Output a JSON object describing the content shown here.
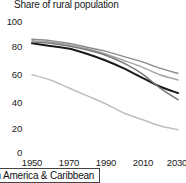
{
  "chart_data": {
    "type": "line",
    "title": "Share of rural population",
    "xlabel": "",
    "ylabel": "",
    "xlim": [
      1950,
      2030
    ],
    "ylim": [
      0,
      100
    ],
    "grid": false,
    "legend_position": "bottom-left",
    "x_ticks": [
      "1950",
      "1970",
      "1990",
      "2010",
      "2030"
    ],
    "y_ticks": [
      "0",
      "20",
      "40",
      "60",
      "80",
      "100"
    ],
    "x": [
      1950,
      1960,
      1970,
      1980,
      1990,
      2000,
      2010,
      2020,
      2030
    ],
    "series": [
      {
        "name": "series-1",
        "color": "#8c8c8c",
        "values": [
          86,
          85,
          83,
          80,
          77,
          73,
          69,
          64,
          60
        ]
      },
      {
        "name": "series-2",
        "color": "#a6a6a6",
        "values": [
          85,
          84,
          82,
          79,
          75,
          70,
          65,
          59,
          55
        ]
      },
      {
        "name": "series-3",
        "color": "#1a1a1a",
        "values": [
          83,
          81,
          79,
          75,
          70,
          64,
          57,
          50,
          45
        ]
      },
      {
        "name": "series-4",
        "color": "#777777",
        "values": [
          84,
          83,
          81,
          78,
          74,
          68,
          60,
          49,
          40
        ]
      },
      {
        "name": "series-5",
        "color": "#bfbfbf",
        "values": [
          59,
          55,
          49,
          43,
          37,
          30,
          25,
          20,
          17
        ]
      }
    ],
    "legend": [
      {
        "label": "tin America & Caribbean"
      }
    ]
  }
}
